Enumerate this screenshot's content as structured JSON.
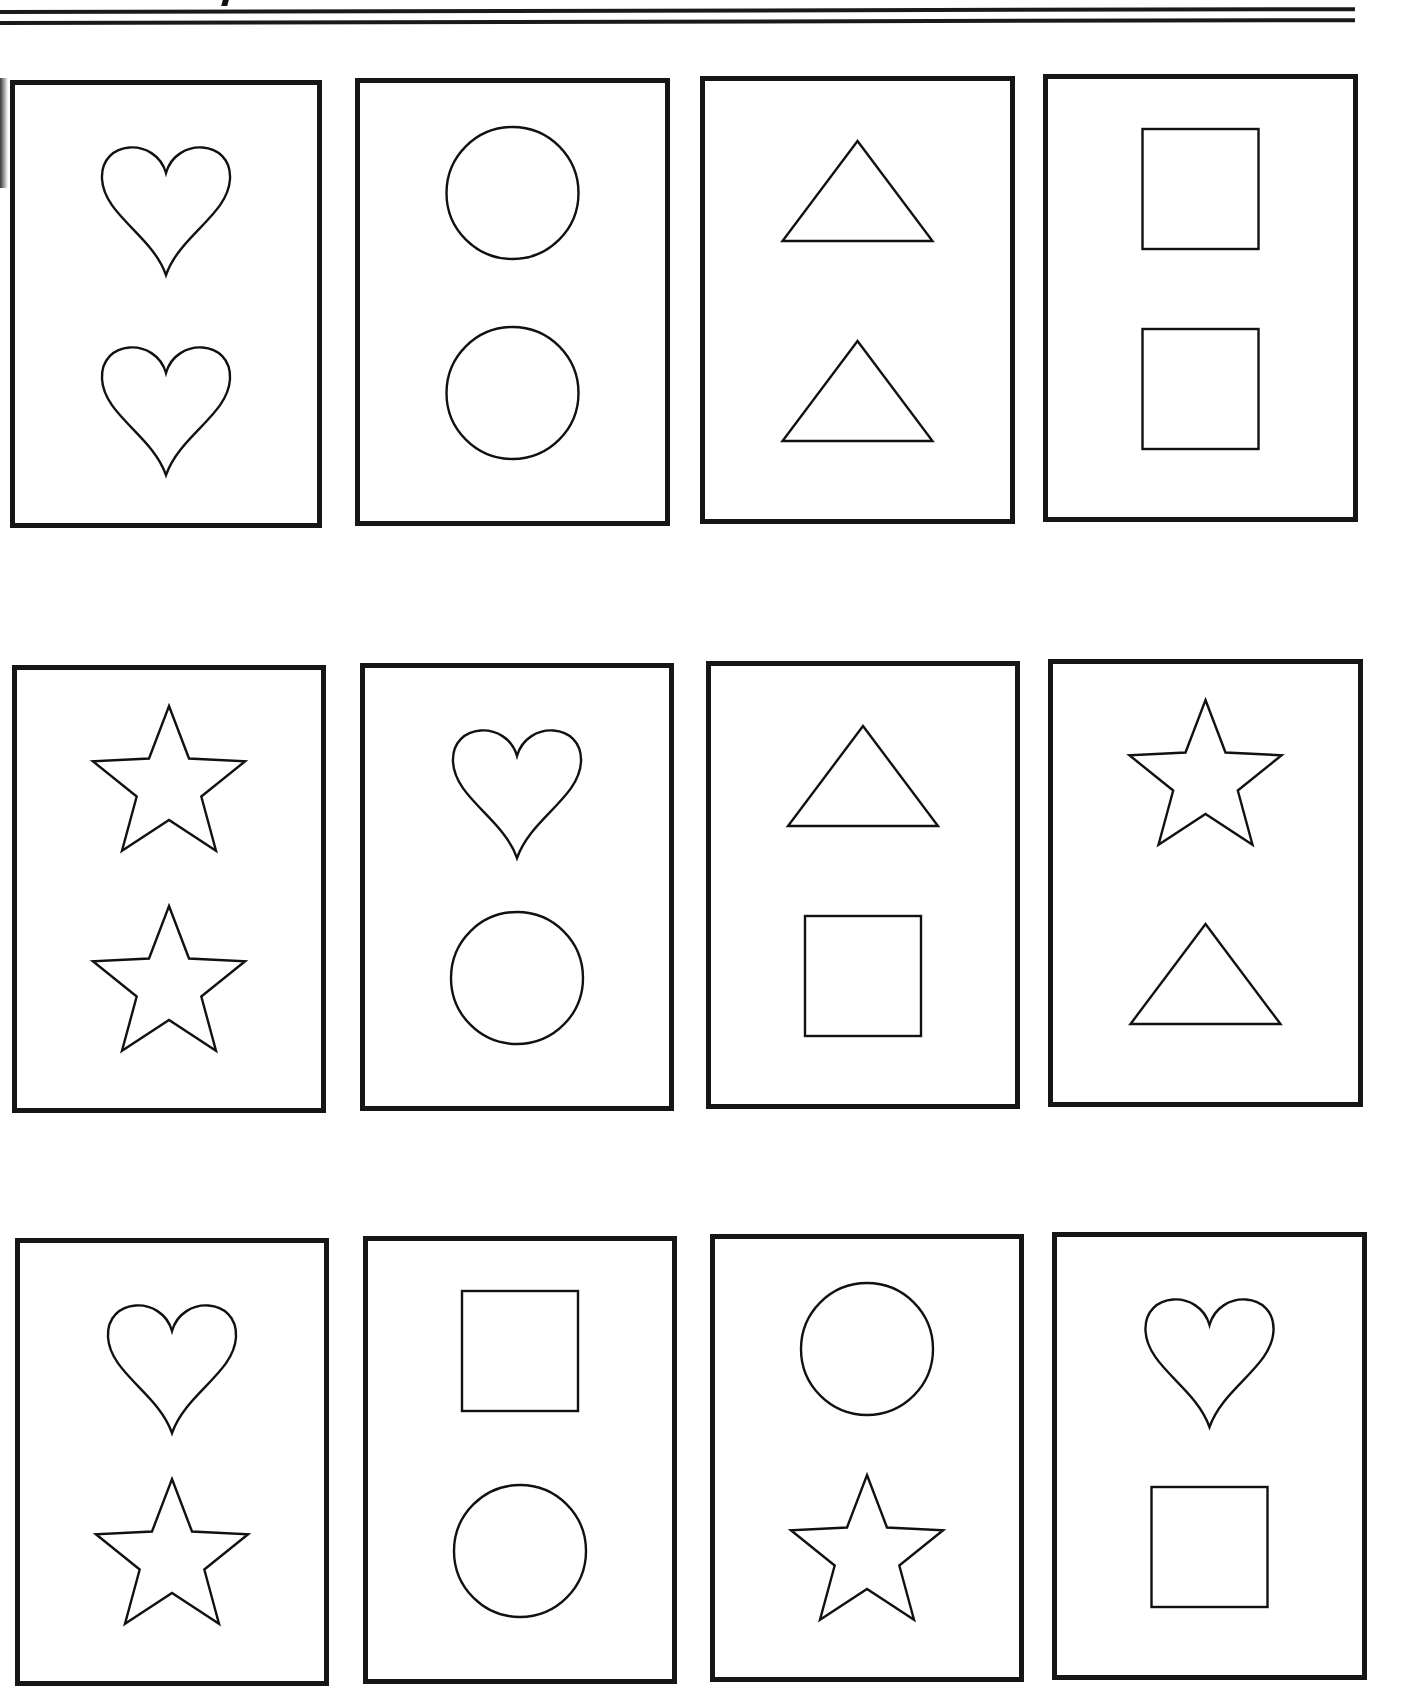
{
  "worksheet": {
    "type": "shape-matching cards",
    "stroke_color": "#111111",
    "background_color": "#ffffff",
    "rows": 3,
    "columns": 4
  },
  "cards": [
    {
      "row": 1,
      "col": 1,
      "x": 10,
      "y": 80,
      "w": 312,
      "h": 448,
      "shapes": [
        "heart",
        "heart"
      ]
    },
    {
      "row": 1,
      "col": 2,
      "x": 355,
      "y": 78,
      "w": 315,
      "h": 448,
      "shapes": [
        "circle",
        "circle"
      ]
    },
    {
      "row": 1,
      "col": 3,
      "x": 700,
      "y": 76,
      "w": 315,
      "h": 448,
      "shapes": [
        "triangle",
        "triangle"
      ]
    },
    {
      "row": 1,
      "col": 4,
      "x": 1043,
      "y": 74,
      "w": 315,
      "h": 448,
      "shapes": [
        "square",
        "square"
      ]
    },
    {
      "row": 2,
      "col": 1,
      "x": 12,
      "y": 665,
      "w": 314,
      "h": 448,
      "shapes": [
        "star",
        "star"
      ]
    },
    {
      "row": 2,
      "col": 2,
      "x": 360,
      "y": 663,
      "w": 314,
      "h": 448,
      "shapes": [
        "heart",
        "circle"
      ]
    },
    {
      "row": 2,
      "col": 3,
      "x": 706,
      "y": 661,
      "w": 314,
      "h": 448,
      "shapes": [
        "triangle",
        "square"
      ]
    },
    {
      "row": 2,
      "col": 4,
      "x": 1048,
      "y": 659,
      "w": 315,
      "h": 448,
      "shapes": [
        "star",
        "triangle"
      ]
    },
    {
      "row": 3,
      "col": 1,
      "x": 15,
      "y": 1238,
      "w": 314,
      "h": 448,
      "shapes": [
        "heart",
        "star"
      ]
    },
    {
      "row": 3,
      "col": 2,
      "x": 363,
      "y": 1236,
      "w": 314,
      "h": 448,
      "shapes": [
        "square",
        "circle"
      ]
    },
    {
      "row": 3,
      "col": 3,
      "x": 710,
      "y": 1234,
      "w": 314,
      "h": 448,
      "shapes": [
        "circle",
        "star"
      ]
    },
    {
      "row": 3,
      "col": 4,
      "x": 1052,
      "y": 1232,
      "w": 315,
      "h": 448,
      "shapes": [
        "heart",
        "square"
      ]
    }
  ]
}
